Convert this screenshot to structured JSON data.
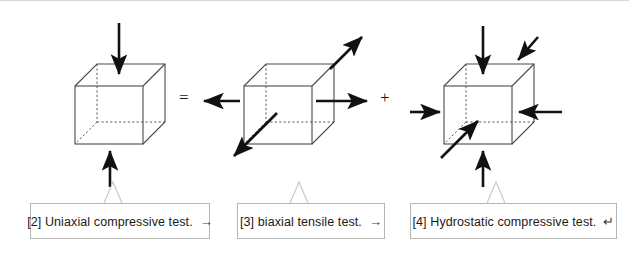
{
  "figure": {
    "background_color": "#ffffff",
    "line_color": "#4a4a4a",
    "arrow_color": "#111111",
    "callout_border_color": "#b6b6b6",
    "callout_leader_color": "#c9c9c9"
  },
  "operators": {
    "equals": "=",
    "plus": "+"
  },
  "cubes": [
    {
      "id": "cube-uniaxial",
      "name": "uniaxial-compression-cube",
      "arrows": [
        {
          "name": "arrow-top-down",
          "direction": "down",
          "sense": "compressive"
        },
        {
          "name": "arrow-bottom-up",
          "direction": "up",
          "sense": "compressive"
        }
      ]
    },
    {
      "id": "cube-biaxial",
      "name": "biaxial-tension-cube",
      "arrows": [
        {
          "name": "arrow-left-out",
          "direction": "left",
          "sense": "tensile"
        },
        {
          "name": "arrow-right-out",
          "direction": "right",
          "sense": "tensile"
        },
        {
          "name": "arrow-depth-front-out",
          "direction": "down-left",
          "sense": "tensile"
        },
        {
          "name": "arrow-depth-back-out",
          "direction": "up-right",
          "sense": "tensile"
        }
      ]
    },
    {
      "id": "cube-hydrostatic",
      "name": "hydrostatic-compression-cube",
      "arrows": [
        {
          "name": "arrow-top-down",
          "direction": "down",
          "sense": "compressive"
        },
        {
          "name": "arrow-bottom-up",
          "direction": "up",
          "sense": "compressive"
        },
        {
          "name": "arrow-left-in",
          "direction": "right",
          "sense": "compressive"
        },
        {
          "name": "arrow-right-in",
          "direction": "left",
          "sense": "compressive"
        },
        {
          "name": "arrow-depth-back-in",
          "direction": "down-left",
          "sense": "compressive"
        },
        {
          "name": "arrow-depth-front-in",
          "direction": "up-right",
          "sense": "compressive"
        }
      ]
    }
  ],
  "callouts": [
    {
      "id": "callout-2",
      "label": "[2] Uniaxial compressive test.",
      "tail_glyph": "→",
      "tail_glyph_name": "right-arrow-pilcrow"
    },
    {
      "id": "callout-3",
      "label": "[3] biaxial tensile test.",
      "tail_glyph": "→",
      "tail_glyph_name": "right-arrow-pilcrow"
    },
    {
      "id": "callout-4",
      "label": "[4] Hydrostatic compressive test.",
      "tail_glyph": "↵",
      "tail_glyph_name": "carriage-return-pilcrow"
    }
  ]
}
